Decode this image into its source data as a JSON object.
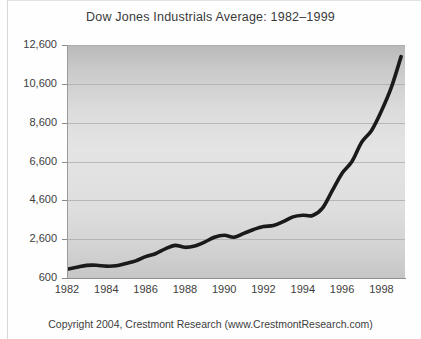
{
  "chart_data": {
    "type": "line",
    "title": "Dow Jones Industrials Average: 1982–1999",
    "xlabel": "",
    "ylabel": "",
    "xlim": [
      1982,
      1999.2
    ],
    "ylim": [
      600,
      12600
    ],
    "yticks": [
      600,
      2600,
      4600,
      6600,
      8600,
      10600,
      12600
    ],
    "ytick_labels": [
      "600",
      "2,600",
      "4,600",
      "6,600",
      "8,600",
      "10,600",
      "12,600"
    ],
    "xticks": [
      1982,
      1984,
      1986,
      1988,
      1990,
      1992,
      1994,
      1996,
      1998
    ],
    "xtick_labels": [
      "1982",
      "1984",
      "1986",
      "1988",
      "1990",
      "1992",
      "1994",
      "1996",
      "1998"
    ],
    "grid": true,
    "grid_axis": "y",
    "legend": false,
    "line_color": "#1a1a1a",
    "line_width": 3.6,
    "plot_background": "#dcdcdc",
    "series": [
      {
        "name": "Dow Jones Industrials Average",
        "x": [
          1982.0,
          1982.5,
          1983.0,
          1983.5,
          1984.0,
          1984.5,
          1985.0,
          1985.5,
          1986.0,
          1986.5,
          1987.0,
          1987.5,
          1988.0,
          1988.5,
          1989.0,
          1989.5,
          1990.0,
          1990.5,
          1991.0,
          1991.5,
          1992.0,
          1992.5,
          1993.0,
          1993.5,
          1994.0,
          1994.5,
          1995.0,
          1995.5,
          1996.0,
          1996.5,
          1997.0,
          1997.5,
          1998.0,
          1998.5,
          1999.0
        ],
        "y": [
          1050,
          1150,
          1250,
          1260,
          1210,
          1230,
          1350,
          1480,
          1700,
          1850,
          2100,
          2280,
          2180,
          2250,
          2450,
          2700,
          2800,
          2700,
          2900,
          3100,
          3250,
          3300,
          3500,
          3750,
          3830,
          3820,
          4200,
          5100,
          6000,
          6600,
          7600,
          8200,
          9200,
          10400,
          12000
        ]
      }
    ]
  },
  "footer": {
    "copyright": "Copyright 2004, Crestmont Research (www.CrestmontResearch.com)"
  }
}
